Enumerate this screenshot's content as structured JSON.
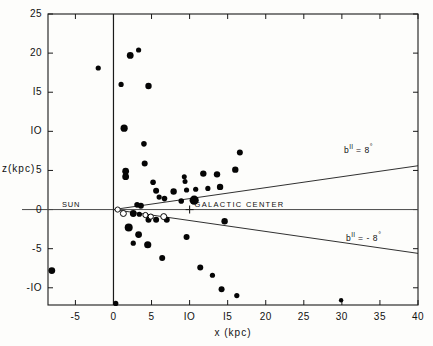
{
  "chart_data": {
    "type": "scatter",
    "title": "",
    "xlabel": "x (kpc)",
    "ylabel": "z(kpc)",
    "xlim": [
      -8.6,
      40
    ],
    "ylim": [
      -12.2,
      25
    ],
    "xticks": [
      -5,
      0,
      5,
      10,
      15,
      20,
      25,
      30,
      35,
      40
    ],
    "xticklabels": [
      "-5",
      "0",
      "5",
      "IO",
      "I5",
      "20",
      "25",
      "30",
      "35",
      "40"
    ],
    "yticks": [
      -10,
      -5,
      0,
      5,
      10,
      15,
      20,
      25
    ],
    "yticklabels": [
      "-IO",
      "-5",
      "0",
      "5",
      "IO",
      "I5",
      "20",
      "25"
    ],
    "grid": false,
    "legend": false,
    "series": [
      {
        "name": "filled-markers",
        "marker": "filled-circle",
        "points": [
          {
            "x": -8.1,
            "y": -7.8,
            "size": 3.4
          },
          {
            "x": -2.0,
            "y": 18.1,
            "size": 2.6
          },
          {
            "x": 2.2,
            "y": 19.7,
            "size": 3.4
          },
          {
            "x": 3.3,
            "y": 20.4,
            "size": 2.6
          },
          {
            "x": 1.0,
            "y": 16.0,
            "size": 2.6
          },
          {
            "x": 4.6,
            "y": 15.8,
            "size": 3.2
          },
          {
            "x": 1.4,
            "y": 10.4,
            "size": 3.6
          },
          {
            "x": 4.0,
            "y": 8.4,
            "size": 2.8
          },
          {
            "x": 16.6,
            "y": 7.3,
            "size": 3.0
          },
          {
            "x": 4.1,
            "y": 5.9,
            "size": 3.0
          },
          {
            "x": 16.0,
            "y": 5.1,
            "size": 3.2
          },
          {
            "x": 1.6,
            "y": 4.9,
            "size": 3.4
          },
          {
            "x": 1.6,
            "y": 4.2,
            "size": 3.4
          },
          {
            "x": 5.2,
            "y": 3.5,
            "size": 2.8
          },
          {
            "x": 9.3,
            "y": 4.2,
            "size": 2.5
          },
          {
            "x": 9.4,
            "y": 3.6,
            "size": 2.5
          },
          {
            "x": 11.8,
            "y": 4.6,
            "size": 3.2
          },
          {
            "x": 13.6,
            "y": 4.5,
            "size": 3.2
          },
          {
            "x": 5.6,
            "y": 2.4,
            "size": 3.0
          },
          {
            "x": 7.9,
            "y": 2.3,
            "size": 3.2
          },
          {
            "x": 9.6,
            "y": 2.5,
            "size": 2.6
          },
          {
            "x": 10.8,
            "y": 2.6,
            "size": 2.6
          },
          {
            "x": 12.4,
            "y": 2.7,
            "size": 2.6
          },
          {
            "x": 14.0,
            "y": 2.9,
            "size": 3.2
          },
          {
            "x": 6.0,
            "y": 1.6,
            "size": 2.6
          },
          {
            "x": 6.7,
            "y": 1.4,
            "size": 2.8
          },
          {
            "x": 8.9,
            "y": 1.1,
            "size": 2.8
          },
          {
            "x": 10.6,
            "y": 1.2,
            "size": 4.6
          },
          {
            "x": 3.1,
            "y": 0.6,
            "size": 2.8
          },
          {
            "x": 3.6,
            "y": 0.5,
            "size": 3.0
          },
          {
            "x": 2.6,
            "y": -0.5,
            "size": 3.4
          },
          {
            "x": 3.4,
            "y": -0.6,
            "size": 2.6
          },
          {
            "x": 4.6,
            "y": -1.3,
            "size": 3.0
          },
          {
            "x": 5.6,
            "y": -1.3,
            "size": 3.0
          },
          {
            "x": 7.0,
            "y": -1.3,
            "size": 3.0
          },
          {
            "x": 14.6,
            "y": -1.5,
            "size": 3.2
          },
          {
            "x": 2.0,
            "y": -2.3,
            "size": 4.0
          },
          {
            "x": 3.3,
            "y": -3.2,
            "size": 3.4
          },
          {
            "x": 9.6,
            "y": -3.5,
            "size": 3.0
          },
          {
            "x": 2.6,
            "y": -4.3,
            "size": 2.6
          },
          {
            "x": 4.5,
            "y": -4.5,
            "size": 3.6
          },
          {
            "x": 6.4,
            "y": -6.2,
            "size": 3.0
          },
          {
            "x": 11.4,
            "y": -7.4,
            "size": 3.0
          },
          {
            "x": 13.0,
            "y": -8.4,
            "size": 2.6
          },
          {
            "x": 14.2,
            "y": -10.2,
            "size": 3.0
          },
          {
            "x": 16.2,
            "y": -11.0,
            "size": 2.6
          },
          {
            "x": 0.3,
            "y": -12.0,
            "size": 2.6
          },
          {
            "x": 29.9,
            "y": -11.6,
            "size": 2.2
          }
        ]
      },
      {
        "name": "open-markers",
        "marker": "open-circle",
        "points": [
          {
            "x": 1.3,
            "y": -0.5,
            "size": 3.0
          },
          {
            "x": 4.2,
            "y": -0.7,
            "size": 2.6
          },
          {
            "x": 4.9,
            "y": -0.9,
            "size": 2.6
          },
          {
            "x": 6.6,
            "y": -0.9,
            "size": 3.0
          }
        ]
      }
    ],
    "reference_lines": [
      {
        "label": "b",
        "superscript": "II",
        "equals": "=",
        "value": "8",
        "unit": "°",
        "from": {
          "x": 0.0,
          "y": 0.0
        },
        "to": {
          "x": 40.0,
          "y": 5.6
        }
      },
      {
        "label": "b",
        "superscript": "II",
        "equals": "=",
        "value": "-8",
        "unit": "°",
        "from": {
          "x": 0.0,
          "y": 0.0
        },
        "to": {
          "x": 40.0,
          "y": -5.6
        }
      }
    ],
    "annotations": [
      {
        "name": "sun",
        "text": "SUN",
        "x": 0.0,
        "y": 0.0
      },
      {
        "name": "galactic-center",
        "text": "GALACTIC CENTER",
        "x": 10.0,
        "y": 0.0
      }
    ]
  },
  "axis": {
    "y_title": "z(kpc)",
    "x_title": "x  (kpc)"
  },
  "labels": {
    "sun": "SUN",
    "galactic_center": "GALACTIC CENTER",
    "b_upper_prefix": "b",
    "b_upper_sup": "II",
    "b_upper_rest": "= 8",
    "b_lower_rest": "= - 8",
    "degree": "°"
  }
}
